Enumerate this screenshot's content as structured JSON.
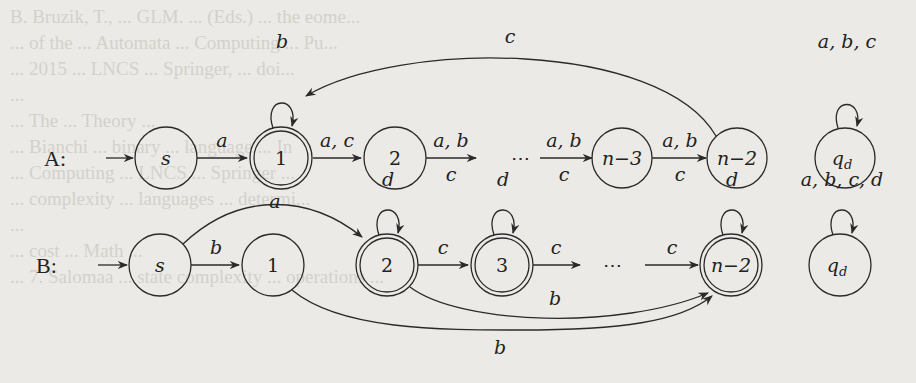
{
  "background_bleedthrough": [
    "B. Bruzik, T., ... GLM. ... (Eds.) ... the eome...",
    "... of the ... Automata ... Computing ... Pu...",
    "... 2015 ... LNCS ... Springer, ... doi...",
    "...",
    "... The ... Theory ...",
    "... Bianchi ... binary ... language ... In",
    "... Computing ... LNCS ... Springer ...",
    "... complexity ... languages ... determi...",
    "...",
    "... cost ... Math ...",
    "... 7. Salomaa ... state complexity ... operations ..."
  ],
  "figure": {
    "automaton_A": {
      "label": "A:",
      "states": [
        {
          "id": "s",
          "label": "s",
          "italic": true,
          "accepting": false,
          "initial": true
        },
        {
          "id": "1",
          "label": "1",
          "italic": false,
          "accepting": true,
          "initial": false
        },
        {
          "id": "2",
          "label": "2",
          "italic": false,
          "accepting": false
        },
        {
          "id": "dots",
          "label": "⋯",
          "italic": false,
          "is_ellipsis": true
        },
        {
          "id": "n-3",
          "label": "n−3",
          "italic": false,
          "accepting": false
        },
        {
          "id": "n-2",
          "label": "n−2",
          "italic": false,
          "accepting": false
        },
        {
          "id": "qd",
          "label": "q",
          "sub": "d",
          "italic": true,
          "accepting": false
        }
      ],
      "transitions": [
        {
          "from": "s",
          "to": "1",
          "label": "a"
        },
        {
          "from": "1",
          "to": "1",
          "label": "b",
          "loop": true
        },
        {
          "from": "1",
          "to": "2",
          "label": "a, c"
        },
        {
          "from": "2",
          "to": "dots",
          "label_top": "a, b",
          "label_bottom": "c"
        },
        {
          "from": "dots",
          "to": "n-3",
          "label_top": "a, b",
          "label_bottom": "c"
        },
        {
          "from": "n-3",
          "to": "n-2",
          "label_top": "a, b",
          "label_bottom": "c"
        },
        {
          "from": "n-2",
          "to": "1",
          "label": "c",
          "curved": true
        },
        {
          "from": "qd",
          "to": "qd",
          "label": "a, b, c",
          "loop": true
        }
      ]
    },
    "automaton_B": {
      "label": "B:",
      "states": [
        {
          "id": "s",
          "label": "s",
          "italic": true,
          "accepting": false,
          "initial": true
        },
        {
          "id": "1",
          "label": "1",
          "accepting": false
        },
        {
          "id": "2",
          "label": "2",
          "accepting": true
        },
        {
          "id": "3",
          "label": "3",
          "accepting": true
        },
        {
          "id": "dots",
          "label": "⋯",
          "is_ellipsis": true
        },
        {
          "id": "n-2",
          "label": "n−2",
          "accepting": true
        },
        {
          "id": "qd",
          "label": "q",
          "sub": "d",
          "italic": true,
          "accepting": false
        }
      ],
      "transitions": [
        {
          "from": "s",
          "to": "1",
          "label": "b"
        },
        {
          "from": "s",
          "to": "2",
          "label": "a",
          "curved": true
        },
        {
          "from": "2",
          "to": "2",
          "label": "d",
          "loop": true
        },
        {
          "from": "3",
          "to": "3",
          "label": "d",
          "loop": true
        },
        {
          "from": "n-2",
          "to": "n-2",
          "label": "d",
          "loop": true
        },
        {
          "from": "2",
          "to": "3",
          "label": "c"
        },
        {
          "from": "3",
          "to": "dots",
          "label": "c"
        },
        {
          "from": "dots",
          "to": "n-2",
          "label": "c"
        },
        {
          "from": "2",
          "to": "n-2",
          "label": "b",
          "curved": true
        },
        {
          "from": "1",
          "to": "n-2",
          "label": "b",
          "curved": true
        },
        {
          "from": "qd",
          "to": "qd",
          "label": "a, b, c, d",
          "loop": true
        }
      ]
    }
  }
}
